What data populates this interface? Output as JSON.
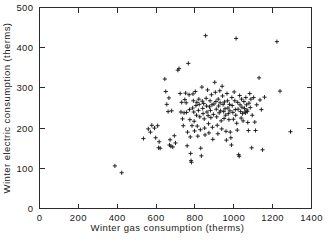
{
  "chart_data": {
    "type": "scatter",
    "title": "",
    "xlabel": "Winter gas consumption (therms)",
    "ylabel": "Winter electric consumption (therms)",
    "xlim": [
      0,
      1400
    ],
    "ylim": [
      0,
      500
    ],
    "xticks": [
      0,
      200,
      400,
      600,
      800,
      1000,
      1200,
      1400
    ],
    "yticks": [
      0,
      100,
      200,
      300,
      400,
      500
    ],
    "xticklabels": [
      "0",
      "200",
      "400",
      "600",
      "800",
      "1000",
      "1200",
      "1400"
    ],
    "yticklabels": [
      "0",
      "100",
      "200",
      "300",
      "400",
      "500"
    ],
    "grid": false,
    "legend": "none",
    "marker": "plus",
    "marker_color": "#1b1b1b",
    "frame": "box",
    "tick_direction": "in",
    "series": [
      {
        "name": "households",
        "points": [
          [
            388,
            106
          ],
          [
            423,
            89
          ],
          [
            535,
            174
          ],
          [
            560,
            198
          ],
          [
            571,
            190
          ],
          [
            578,
            207
          ],
          [
            592,
            200
          ],
          [
            598,
            176
          ],
          [
            608,
            206
          ],
          [
            613,
            151
          ],
          [
            616,
            166
          ],
          [
            621,
            150
          ],
          [
            645,
            322
          ],
          [
            650,
            291
          ],
          [
            655,
            259
          ],
          [
            662,
            241
          ],
          [
            666,
            275
          ],
          [
            669,
            158
          ],
          [
            672,
            171
          ],
          [
            676,
            155
          ],
          [
            680,
            243
          ],
          [
            686,
            153
          ],
          [
            694,
            181
          ],
          [
            700,
            163
          ],
          [
            712,
            344
          ],
          [
            718,
            348
          ],
          [
            724,
            286
          ],
          [
            728,
            240
          ],
          [
            732,
            264
          ],
          [
            736,
            223
          ],
          [
            740,
            206
          ],
          [
            744,
            238
          ],
          [
            748,
            271
          ],
          [
            752,
            287
          ],
          [
            755,
            263
          ],
          [
            757,
            239
          ],
          [
            760,
            156
          ],
          [
            762,
            190
          ],
          [
            766,
            361
          ],
          [
            770,
            283
          ],
          [
            772,
            246
          ],
          [
            774,
            221
          ],
          [
            776,
            178
          ],
          [
            778,
            137
          ],
          [
            780,
            119
          ],
          [
            782,
            115
          ],
          [
            785,
            206
          ],
          [
            788,
            250
          ],
          [
            790,
            285
          ],
          [
            792,
            268
          ],
          [
            794,
            240
          ],
          [
            796,
            217
          ],
          [
            798,
            193
          ],
          [
            802,
            291
          ],
          [
            805,
            256
          ],
          [
            808,
            232
          ],
          [
            810,
            264
          ],
          [
            812,
            205
          ],
          [
            815,
            180
          ],
          [
            818,
            244
          ],
          [
            820,
            272
          ],
          [
            822,
            259
          ],
          [
            825,
            228
          ],
          [
            828,
            196
          ],
          [
            830,
            150
          ],
          [
            833,
            131
          ],
          [
            836,
            302
          ],
          [
            838,
            267
          ],
          [
            840,
            249
          ],
          [
            842,
            236
          ],
          [
            845,
            261
          ],
          [
            848,
            223
          ],
          [
            850,
            200
          ],
          [
            852,
            183
          ],
          [
            855,
            430
          ],
          [
            858,
            274
          ],
          [
            860,
            255
          ],
          [
            862,
            240
          ],
          [
            865,
            295
          ],
          [
            868,
            231
          ],
          [
            870,
            211
          ],
          [
            872,
            188
          ],
          [
            875,
            253
          ],
          [
            878,
            268
          ],
          [
            880,
            244
          ],
          [
            882,
            226
          ],
          [
            885,
            283
          ],
          [
            888,
            258
          ],
          [
            890,
            202
          ],
          [
            892,
            172
          ],
          [
            895,
            234
          ],
          [
            898,
            260
          ],
          [
            902,
            314
          ],
          [
            905,
            289
          ],
          [
            908,
            266
          ],
          [
            910,
            247
          ],
          [
            912,
            228
          ],
          [
            915,
            207
          ],
          [
            918,
            186
          ],
          [
            920,
            272
          ],
          [
            922,
            255
          ],
          [
            925,
            238
          ],
          [
            928,
            293
          ],
          [
            930,
            263
          ],
          [
            932,
            243
          ],
          [
            935,
            218
          ],
          [
            938,
            198
          ],
          [
            940,
            304
          ],
          [
            942,
            280
          ],
          [
            945,
            259
          ],
          [
            948,
            241
          ],
          [
            950,
            224
          ],
          [
            952,
            265
          ],
          [
            955,
            248
          ],
          [
            958,
            232
          ],
          [
            960,
            192
          ],
          [
            962,
            170
          ],
          [
            965,
            286
          ],
          [
            968,
            268
          ],
          [
            970,
            250
          ],
          [
            972,
            236
          ],
          [
            975,
            221
          ],
          [
            978,
            259
          ],
          [
            980,
            243
          ],
          [
            982,
            190
          ],
          [
            985,
            176
          ],
          [
            988,
            158
          ],
          [
            990,
            276
          ],
          [
            992,
            256
          ],
          [
            995,
            239
          ],
          [
            998,
            222
          ],
          [
            1002,
            290
          ],
          [
            1005,
            268
          ],
          [
            1008,
            246
          ],
          [
            1010,
            232
          ],
          [
            1012,
            423
          ],
          [
            1015,
            212
          ],
          [
            1018,
            195
          ],
          [
            1020,
            264
          ],
          [
            1022,
            247
          ],
          [
            1025,
            134
          ],
          [
            1028,
            130
          ],
          [
            1030,
            281
          ],
          [
            1032,
            258
          ],
          [
            1035,
            241
          ],
          [
            1038,
            225
          ],
          [
            1040,
            272
          ],
          [
            1042,
            252
          ],
          [
            1045,
            236
          ],
          [
            1048,
            218
          ],
          [
            1052,
            266
          ],
          [
            1055,
            249
          ],
          [
            1058,
            240
          ],
          [
            1060,
            238
          ],
          [
            1062,
            276
          ],
          [
            1065,
            258
          ],
          [
            1068,
            245
          ],
          [
            1070,
            241
          ],
          [
            1072,
            214
          ],
          [
            1075,
            194
          ],
          [
            1078,
            262
          ],
          [
            1082,
            286
          ],
          [
            1085,
            251
          ],
          [
            1088,
            272
          ],
          [
            1092,
            151
          ],
          [
            1095,
            232
          ],
          [
            1102,
            276
          ],
          [
            1108,
            215
          ],
          [
            1112,
            194
          ],
          [
            1118,
            258
          ],
          [
            1130,
            325
          ],
          [
            1135,
            270
          ],
          [
            1142,
            246
          ],
          [
            1148,
            146
          ],
          [
            1158,
            277
          ],
          [
            1222,
            415
          ],
          [
            1238,
            292
          ],
          [
            1292,
            191
          ]
        ]
      }
    ]
  }
}
